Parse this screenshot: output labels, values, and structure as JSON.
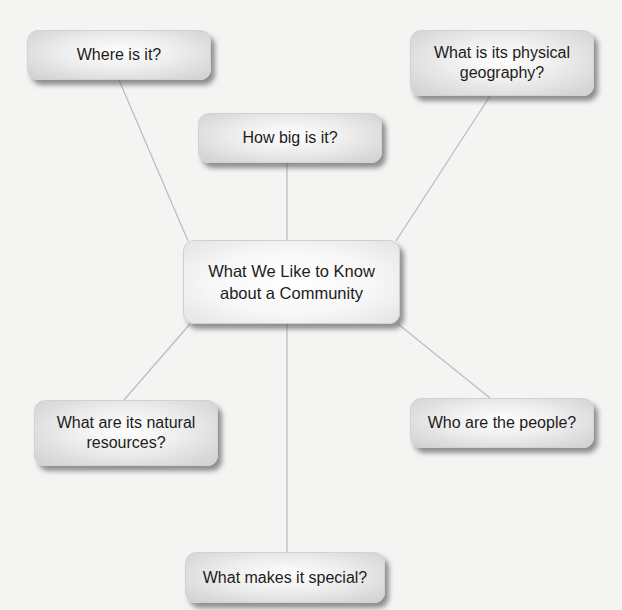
{
  "diagram": {
    "type": "concept-map",
    "central": {
      "label_line1": "What We Like to Know",
      "label_line2": "about a Community"
    },
    "nodes": [
      {
        "id": "where",
        "line1": "Where is it?",
        "line2": ""
      },
      {
        "id": "physical-geography",
        "line1": "What is its physical",
        "line2": "geography?"
      },
      {
        "id": "how-big",
        "line1": "How big is it?",
        "line2": ""
      },
      {
        "id": "natural-resources",
        "line1": "What are its natural",
        "line2": "resources?"
      },
      {
        "id": "people",
        "line1": "Who are the people?",
        "line2": ""
      },
      {
        "id": "special",
        "line1": "What makes it special?",
        "line2": ""
      }
    ],
    "colors": {
      "background": "#f4f4f3",
      "connector": "#bdbdbd",
      "text": "#1c1c1c"
    }
  }
}
